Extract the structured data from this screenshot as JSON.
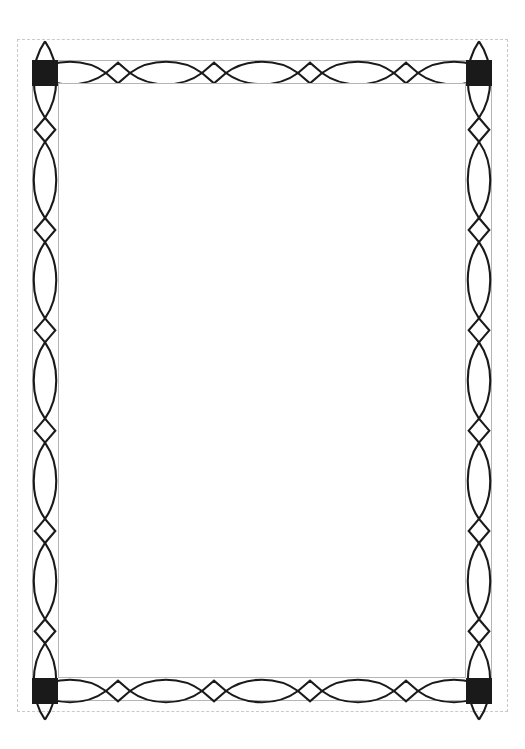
{
  "document": {
    "title": "Decorative Ornamental Border Frame",
    "page_width": 525,
    "page_height": 749,
    "background_color": "#ffffff"
  },
  "guides": {
    "margin_guide": {
      "name": "page-margin-guide",
      "style": "dashed",
      "color": "#c9c9c9",
      "x": 17,
      "y": 39,
      "width": 491,
      "height": 673
    },
    "inner_rule": {
      "name": "inner-frame-rule",
      "style": "solid",
      "color": "#b5b5b5",
      "x": 58,
      "y": 83,
      "width": 408,
      "height": 595
    },
    "outer_rule": {
      "name": "outer-frame-rule",
      "style": "solid",
      "color": "#b5b5b5",
      "x": 32,
      "y": 60,
      "width": 460,
      "height": 641
    }
  },
  "frame": {
    "stroke_color": "#1a1a1a",
    "stroke_width": 2.1,
    "fill": "none",
    "band_thickness": 26,
    "outer": {
      "x": 32,
      "y": 60,
      "width": 460,
      "height": 641
    },
    "inner": {
      "x": 58,
      "y": 83,
      "width": 408,
      "height": 595
    }
  },
  "corners": {
    "fill_color": "#1a1a1a",
    "size": 26,
    "items": [
      {
        "name": "corner-block-top-left",
        "x": 32,
        "y": 60
      },
      {
        "name": "corner-block-top-right",
        "x": 466,
        "y": 60
      },
      {
        "name": "corner-block-bottom-left",
        "x": 32,
        "y": 678
      },
      {
        "name": "corner-block-bottom-right",
        "x": 466,
        "y": 678
      }
    ]
  },
  "ornament": {
    "motif": "interlaced-lens-and-diamond-chain",
    "description": "Two mirrored wave strands crossing to form pointed-oval lenses separated by small upright diamonds.",
    "horizontal": {
      "name": "horizontal-ornament-band",
      "span_start": 58,
      "span_end": 466,
      "span_length": 408,
      "lens_count": 5,
      "diamond_count": 4,
      "lens_length": 72.0,
      "diamond_half_width": 12.0,
      "amplitude": 11.2
    },
    "vertical": {
      "name": "vertical-ornament-band",
      "span_start": 83,
      "span_end": 678,
      "span_length": 595,
      "lens_count": 7,
      "diamond_count": 6,
      "lens_length": 76.3,
      "diamond_half_width": 12.0,
      "amplitude": 11.2
    }
  },
  "content_area": {
    "name": "blank-content-area",
    "text": "",
    "x": 58,
    "y": 83,
    "width": 408,
    "height": 595,
    "background_color": "#ffffff"
  }
}
